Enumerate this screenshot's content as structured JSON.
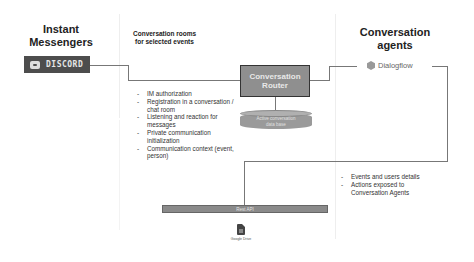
{
  "columns": {
    "left": {
      "title": "Instant\nMessengers",
      "title_line1": "Instant",
      "title_line2": "Messengers"
    },
    "middle": {
      "subtitle_line1": "Conversation rooms",
      "subtitle_line2": "for selected events"
    },
    "right": {
      "title_line1": "Conversation",
      "title_line2": "agents"
    }
  },
  "nodes": {
    "discord": {
      "label": "DISCORD",
      "icon": "discord-logo-icon"
    },
    "router": {
      "line1": "Conversation",
      "line2": "Router"
    },
    "database": {
      "line1": "Active conversation",
      "line2": "data base",
      "icon": "database-cylinder-icon"
    },
    "dialogflow": {
      "label": "Dialogflow",
      "icon": "dialogflow-logo-icon"
    },
    "rest_api": {
      "label": "Rest API"
    },
    "google_drive": {
      "label": "Google Drive",
      "icon": "google-sheets-icon"
    }
  },
  "router_features": [
    {
      "text": "IM authorization"
    },
    {
      "text": "Registration in a conversation / chat room"
    },
    {
      "text": "Listening and reaction for messages"
    },
    {
      "text": "Private communication initialization"
    },
    {
      "text": "Communication context (event, person)"
    }
  ],
  "agent_features": [
    {
      "text": "Events and users details"
    },
    {
      "text": "Actions exposed to Conversation Agents"
    }
  ],
  "colors": {
    "box_fill": "#8f8f8f",
    "box_border": "#333333",
    "line": "#777777",
    "text": "#222222"
  }
}
